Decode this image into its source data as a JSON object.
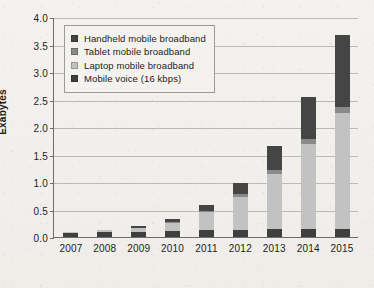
{
  "chart_data": {
    "type": "bar",
    "stacked": true,
    "title": "",
    "subtitle": "",
    "xlabel": "",
    "ylabel": "Exabytes",
    "ylim": [
      0.0,
      4.0
    ],
    "ytick_step": 0.5,
    "ytick_labels": [
      "0.0",
      "0.5",
      "1.0",
      "1.5",
      "2.0",
      "2.5",
      "3.0",
      "3.5",
      "4.0"
    ],
    "ytick_values": [
      0.0,
      0.5,
      1.0,
      1.5,
      2.0,
      2.5,
      3.0,
      3.5,
      4.0
    ],
    "grid": true,
    "grid_axis": "y",
    "legend_position": "top-left",
    "categories": [
      "2007",
      "2008",
      "2009",
      "2010",
      "2011",
      "2012",
      "2013",
      "2014",
      "2015"
    ],
    "series": [
      {
        "name": "Mobile voice (16 kbps)",
        "color": "#3f3f3f",
        "values": [
          0.07,
          0.09,
          0.1,
          0.11,
          0.12,
          0.13,
          0.14,
          0.15,
          0.15
        ]
      },
      {
        "name": "Laptop mobile broadband",
        "color": "#c2c2c2",
        "values": [
          0.02,
          0.03,
          0.06,
          0.14,
          0.33,
          0.6,
          1.01,
          1.55,
          2.11
        ]
      },
      {
        "name": "Tablet mobile broadband",
        "color": "#8a8a8a",
        "values": [
          0.0,
          0.0,
          0.01,
          0.02,
          0.03,
          0.05,
          0.07,
          0.09,
          0.11
        ]
      },
      {
        "name": "Handheld mobile broadband",
        "color": "#454545",
        "values": [
          0.0,
          0.01,
          0.03,
          0.06,
          0.1,
          0.2,
          0.43,
          0.75,
          1.31
        ]
      }
    ],
    "totals": [
      0.09,
      0.13,
      0.2,
      0.33,
      0.58,
      0.98,
      1.65,
      2.54,
      3.68
    ],
    "legend_order_displayed": [
      "Handheld mobile broadband",
      "Tablet mobile broadband",
      "Laptop mobile broadband",
      "Mobile voice (16 kbps)"
    ]
  },
  "legend": {
    "items": [
      {
        "label": "Handheld mobile broadband",
        "color": "#454545"
      },
      {
        "label": "Tablet mobile broadband",
        "color": "#8a8a8a"
      },
      {
        "label": "Laptop mobile broadband",
        "color": "#c2c2c2"
      },
      {
        "label": "Mobile voice (16 kbps)",
        "color": "#3f3f3f"
      }
    ]
  }
}
